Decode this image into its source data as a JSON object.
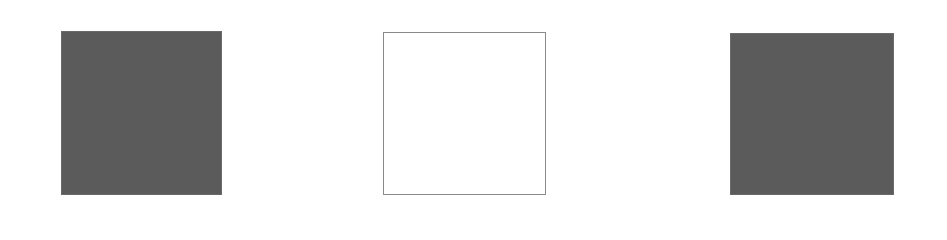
{
  "figure": {
    "background": "#ffffff",
    "squares": [
      {
        "id": "left",
        "style": "filled",
        "fill": "#5b5b5b",
        "x": 61,
        "y": 31,
        "width": 161,
        "height": 164
      },
      {
        "id": "middle",
        "style": "outline",
        "fill": "#ffffff",
        "stroke": "#8a8a8a",
        "x": 383,
        "y": 32,
        "width": 163,
        "height": 163
      },
      {
        "id": "right",
        "style": "filled",
        "fill": "#5b5b5b",
        "x": 730,
        "y": 33,
        "width": 164,
        "height": 162
      }
    ]
  }
}
